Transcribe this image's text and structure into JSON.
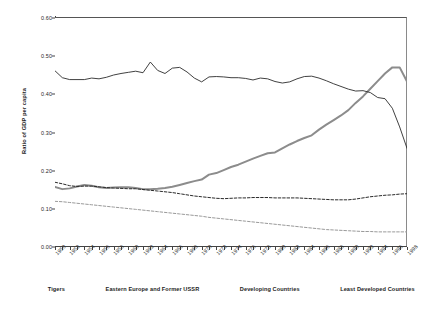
{
  "chart_data": {
    "type": "line",
    "title": "",
    "xlabel": "",
    "ylabel": "Ratio of GDP per capita",
    "ylim": [
      0.0,
      0.6
    ],
    "xlim": [
      1950,
      1998
    ],
    "yticks": [
      "0.00",
      "0.10",
      "0.20",
      "0.30",
      "0.40",
      "0.50",
      "0.60"
    ],
    "ytick_values": [
      0.0,
      0.1,
      0.2,
      0.3,
      0.4,
      0.5,
      0.6
    ],
    "grid": false,
    "legend_position": "bottom",
    "x": [
      1950,
      1951,
      1952,
      1953,
      1954,
      1955,
      1956,
      1957,
      1958,
      1959,
      1960,
      1961,
      1962,
      1963,
      1964,
      1965,
      1966,
      1967,
      1968,
      1969,
      1970,
      1971,
      1972,
      1973,
      1974,
      1975,
      1976,
      1977,
      1978,
      1979,
      1980,
      1981,
      1982,
      1983,
      1984,
      1985,
      1986,
      1987,
      1988,
      1989,
      1990,
      1991,
      1992,
      1993,
      1994,
      1995,
      1996,
      1997,
      1998
    ],
    "xtick_labels": [
      "1950",
      "1952",
      "1954",
      "1956",
      "1958",
      "1960",
      "1962",
      "1964",
      "1966",
      "1968",
      "1970",
      "1972",
      "1974",
      "1976",
      "1978",
      "1980",
      "1982",
      "1984",
      "1986",
      "1988",
      "1990",
      "1992",
      "1994",
      "1996",
      "1998"
    ],
    "series": [
      {
        "name": "Tigers",
        "color": "#8c8c8c",
        "style": "solid",
        "width": 2.0,
        "values": [
          0.155,
          0.149,
          0.151,
          0.156,
          0.16,
          0.158,
          0.154,
          0.152,
          0.153,
          0.154,
          0.154,
          0.152,
          0.149,
          0.149,
          0.15,
          0.152,
          0.155,
          0.16,
          0.165,
          0.17,
          0.174,
          0.187,
          0.191,
          0.199,
          0.207,
          0.213,
          0.221,
          0.229,
          0.236,
          0.243,
          0.245,
          0.256,
          0.266,
          0.275,
          0.283,
          0.29,
          0.305,
          0.318,
          0.33,
          0.342,
          0.356,
          0.375,
          0.392,
          0.412,
          0.432,
          0.452,
          0.468,
          0.468,
          0.431
        ]
      },
      {
        "name": "Eastern Europe and Former USSR",
        "color": "#2b2b2b",
        "style": "solid",
        "width": 0.9,
        "values": [
          0.459,
          0.441,
          0.436,
          0.436,
          0.436,
          0.44,
          0.438,
          0.442,
          0.448,
          0.452,
          0.455,
          0.458,
          0.454,
          0.482,
          0.46,
          0.452,
          0.466,
          0.468,
          0.456,
          0.44,
          0.43,
          0.443,
          0.444,
          0.443,
          0.441,
          0.441,
          0.439,
          0.435,
          0.44,
          0.438,
          0.431,
          0.427,
          0.43,
          0.438,
          0.444,
          0.445,
          0.44,
          0.433,
          0.425,
          0.418,
          0.411,
          0.406,
          0.407,
          0.402,
          0.389,
          0.386,
          0.361,
          0.312,
          0.256
        ]
      },
      {
        "name": "Developing Countries",
        "color": "#2b2b2b",
        "style": "dashed",
        "width": 1.0,
        "values": [
          0.167,
          0.163,
          0.158,
          0.156,
          0.157,
          0.157,
          0.155,
          0.153,
          0.152,
          0.151,
          0.15,
          0.15,
          0.148,
          0.146,
          0.144,
          0.142,
          0.14,
          0.137,
          0.134,
          0.131,
          0.129,
          0.127,
          0.125,
          0.124,
          0.125,
          0.126,
          0.126,
          0.127,
          0.127,
          0.127,
          0.126,
          0.126,
          0.126,
          0.126,
          0.125,
          0.124,
          0.123,
          0.122,
          0.121,
          0.121,
          0.121,
          0.123,
          0.126,
          0.129,
          0.131,
          0.133,
          0.134,
          0.136,
          0.137
        ]
      },
      {
        "name": "Least Developed Countries",
        "color": "#9a9a9a",
        "style": "dashed",
        "width": 1.0,
        "values": [
          0.117,
          0.116,
          0.114,
          0.112,
          0.11,
          0.108,
          0.106,
          0.104,
          0.102,
          0.1,
          0.098,
          0.096,
          0.094,
          0.092,
          0.09,
          0.088,
          0.086,
          0.084,
          0.082,
          0.08,
          0.078,
          0.075,
          0.073,
          0.071,
          0.069,
          0.067,
          0.065,
          0.063,
          0.061,
          0.059,
          0.057,
          0.055,
          0.053,
          0.051,
          0.049,
          0.047,
          0.045,
          0.043,
          0.042,
          0.041,
          0.04,
          0.039,
          0.038,
          0.038,
          0.037,
          0.037,
          0.037,
          0.037,
          0.037
        ]
      }
    ]
  },
  "axes": {
    "ylabel": "Ratio of GDP per capita"
  },
  "legend": {
    "items": [
      {
        "label": "Tigers"
      },
      {
        "label": "Eastern Europe and Former USSR"
      },
      {
        "label": "Developing Countries"
      },
      {
        "label": "Least Developed Countries"
      }
    ]
  },
  "caption": {
    "text": ""
  }
}
